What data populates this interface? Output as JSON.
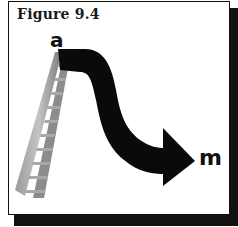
{
  "figure": {
    "title": "Figure 9.4",
    "start_label": "a",
    "end_label": "m",
    "elements": {
      "ladder": "ladder-icon",
      "arrow": "curved-arrow"
    },
    "colors": {
      "arrow": "#0a0a0a",
      "ladder_dark": "#6e6e6e",
      "ladder_light": "#bdbdbd",
      "frame_shadow": "#111111",
      "background": "#ffffff"
    }
  }
}
